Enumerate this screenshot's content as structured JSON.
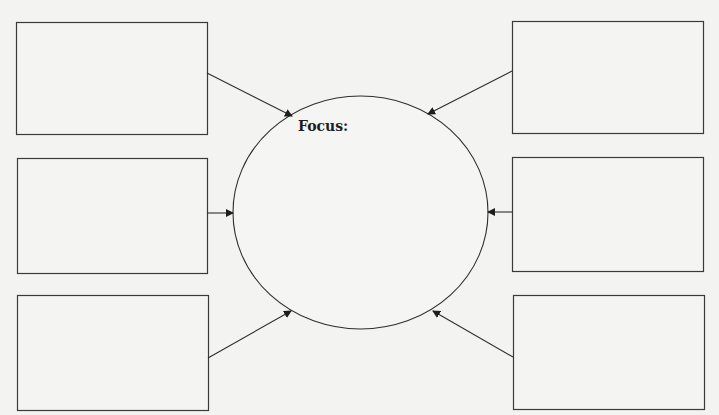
{
  "diagram": {
    "type": "concept-map",
    "center": {
      "label": "Focus:",
      "text": ""
    },
    "boxes": [
      {
        "id": "top-left",
        "text": ""
      },
      {
        "id": "middle-left",
        "text": ""
      },
      {
        "id": "bottom-left",
        "text": ""
      },
      {
        "id": "top-right",
        "text": ""
      },
      {
        "id": "middle-right",
        "text": ""
      },
      {
        "id": "bottom-right",
        "text": ""
      }
    ],
    "edges": [
      {
        "from": "top-left",
        "to": "center"
      },
      {
        "from": "middle-left",
        "to": "center"
      },
      {
        "from": "bottom-left",
        "to": "center"
      },
      {
        "from": "top-right",
        "to": "center"
      },
      {
        "from": "middle-right",
        "to": "center"
      },
      {
        "from": "bottom-right",
        "to": "center"
      }
    ],
    "colors": {
      "stroke": "#2e2e2e",
      "background": "#f3f3f1"
    }
  }
}
